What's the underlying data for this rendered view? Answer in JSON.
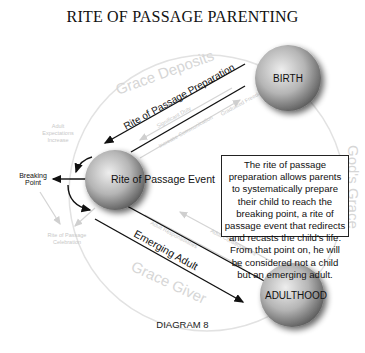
{
  "title": "RITE OF PASSAGE PARENTING",
  "caption": "DIAGRAM 8",
  "nodes": {
    "birth": "BIRTH",
    "event": "Rite of Passage Event",
    "adulthood": "ADULTHOOD"
  },
  "arrows": {
    "preparation": "Rite of Passage Preparation",
    "emerging": "Emerging Adult",
    "breaking_point": "Breaking Point"
  },
  "cycle_labels": {
    "grace_deposits": "Grace Deposits",
    "gods_grace": "God's Grace",
    "grace_giver": "Grace Giver"
  },
  "faint_labels": {
    "adult_expectations": "Adult Expectations Increase",
    "celebration": "Rite of Passage Celebration",
    "significant_duty": "Significant Duty",
    "graduated_freedom": "Graduated Freedom",
    "adult_consequences": "Adult Consequences",
    "adult_responsibilities": "Adult Responsibilities",
    "one_on_one": "Increase Communication"
  },
  "description": "The rite of passage preparation allows parents to systematically prepare their child to reach the breaking point, a rite of passage event that redirects and recasts the child's life. From that point on, he will be considered not a child but an emerging adult.",
  "colors": {
    "sphere_light": "#e6e6e6",
    "sphere_dark": "#6e6e6e",
    "faint": "#cfcfcf",
    "ink": "#111111"
  }
}
